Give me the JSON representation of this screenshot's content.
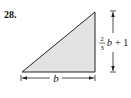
{
  "problem": {
    "number": "28."
  },
  "figure": {
    "shape": "right-triangle",
    "fill_color": "#e3e3e3",
    "stroke_color": "#222222",
    "base_label": "b",
    "height_label": {
      "fraction_numerator": "2",
      "fraction_denominator": "3",
      "variable": "b",
      "rest": "+ 1"
    }
  }
}
